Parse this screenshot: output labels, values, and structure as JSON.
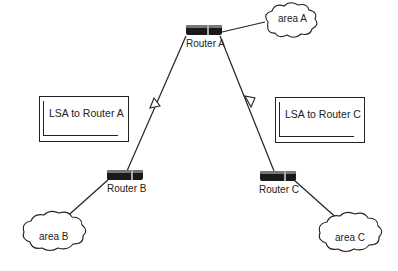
{
  "diagram": {
    "type": "network",
    "routers": [
      {
        "id": "A",
        "label": "Router A"
      },
      {
        "id": "B",
        "label": "Router B"
      },
      {
        "id": "C",
        "label": "Router C"
      }
    ],
    "areas": [
      {
        "id": "A",
        "label": "area A",
        "attached_to": "Router A"
      },
      {
        "id": "B",
        "label": "area B",
        "attached_to": "Router B"
      },
      {
        "id": "C",
        "label": "area C",
        "attached_to": "Router C"
      }
    ],
    "links": [
      {
        "from": "Router B",
        "to": "Router A",
        "arrow": "toward Router A"
      },
      {
        "from": "Router A",
        "to": "Router C",
        "arrow": "toward Router C"
      }
    ],
    "messages": [
      {
        "label": "LSA to Router A"
      },
      {
        "label": "LSA to Router C"
      }
    ]
  }
}
